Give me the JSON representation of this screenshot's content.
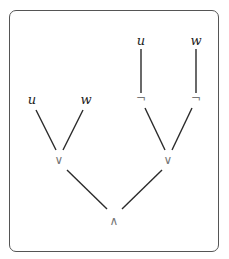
{
  "diagram": {
    "type": "formula-tree",
    "nodes": [
      {
        "id": "u1",
        "label": "u",
        "kind": "variable",
        "x": 32,
        "y": 100
      },
      {
        "id": "w1",
        "label": "w",
        "kind": "variable",
        "x": 86,
        "y": 100
      },
      {
        "id": "or1",
        "label": "∨",
        "kind": "operator",
        "x": 59,
        "y": 160
      },
      {
        "id": "u2",
        "label": "u",
        "kind": "variable",
        "x": 141,
        "y": 42
      },
      {
        "id": "w2",
        "label": "w",
        "kind": "variable",
        "x": 196,
        "y": 42
      },
      {
        "id": "not1",
        "label": "¬",
        "kind": "operator",
        "x": 141,
        "y": 99
      },
      {
        "id": "not2",
        "label": "¬",
        "kind": "operator",
        "x": 196,
        "y": 99
      },
      {
        "id": "or2",
        "label": "∨",
        "kind": "operator",
        "x": 168,
        "y": 160
      },
      {
        "id": "and",
        "label": "∧",
        "kind": "operator",
        "x": 114,
        "y": 222
      }
    ],
    "edges": [
      {
        "from": "u1",
        "to": "or1"
      },
      {
        "from": "w1",
        "to": "or1"
      },
      {
        "from": "u2",
        "to": "not1"
      },
      {
        "from": "w2",
        "to": "not2"
      },
      {
        "from": "not1",
        "to": "or2"
      },
      {
        "from": "not2",
        "to": "or2"
      },
      {
        "from": "or1",
        "to": "and"
      },
      {
        "from": "or2",
        "to": "and"
      }
    ]
  }
}
